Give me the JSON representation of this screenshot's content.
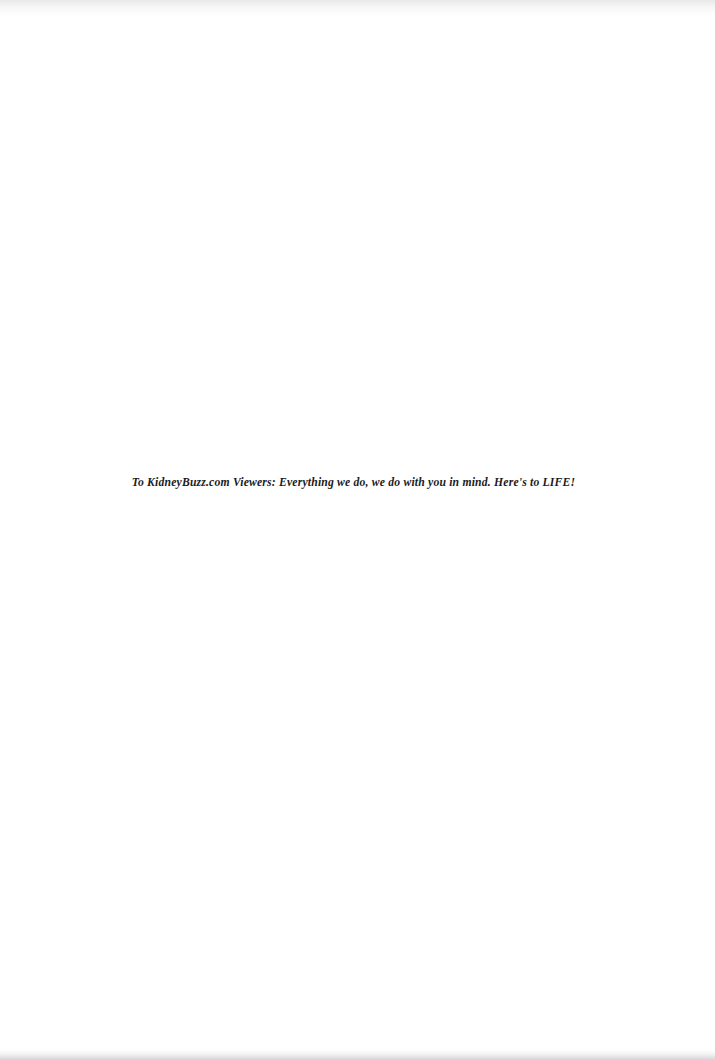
{
  "document": {
    "page_background_color": "#ffffff",
    "text_color": "#1b1b1b",
    "body": {
      "dedication_line": "To KidneyBuzz.com Viewers: Everything we do, we do with you in mind. Here's to LIFE!"
    }
  }
}
